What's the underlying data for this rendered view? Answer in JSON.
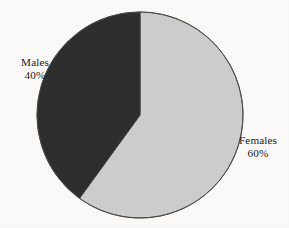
{
  "chart_data": {
    "type": "pie",
    "title": "",
    "subtitle": "",
    "xlabel": "",
    "ylabel": "",
    "legend_position": "none",
    "grid": false,
    "start_angle_deg": 0,
    "direction": "clockwise",
    "categories": [
      "Females",
      "Males"
    ],
    "values": [
      60,
      40
    ],
    "unit": "%",
    "slices": [
      {
        "label": "Females",
        "value": 60,
        "value_text": "60%",
        "color": "#cdcdcd",
        "start_angle_deg": 0,
        "end_angle_deg": 216,
        "label_side": "right"
      },
      {
        "label": "Males",
        "value": 40,
        "value_text": "40%",
        "color": "#2e2e2e",
        "start_angle_deg": 216,
        "end_angle_deg": 360,
        "label_side": "left"
      }
    ],
    "annotations": []
  },
  "figure": {
    "background_color": "#fbfaf8",
    "outline_color": "#3a3a3a",
    "text_color": "#1b1b1b",
    "center_x": 140,
    "center_y": 115,
    "radius": 103
  }
}
